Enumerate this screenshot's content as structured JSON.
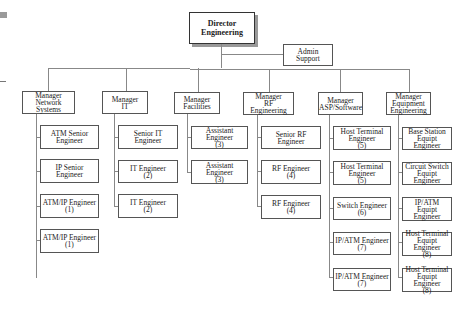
{
  "director": {
    "label": "Director\nEngineering"
  },
  "admin": {
    "label": "Admin Support"
  },
  "managers": [
    {
      "label": "Manager\nNetwork Systems",
      "reports": [
        "ATM Senior\nEngineer",
        "IP Senior Engineer",
        "ATM/IP Engineer\n(1)",
        "ATM/IP Engineer\n(1)"
      ]
    },
    {
      "label": "Manager\nIT",
      "reports": [
        "Senior IT Engineer",
        "IT Engineer\n(2)",
        "IT Engineer\n(2)"
      ]
    },
    {
      "label": "Manager\nFacilities",
      "reports": [
        "Assistant Engineer\n(3)",
        "Assistant Engineer\n(3)"
      ]
    },
    {
      "label": "Manager\nRF Engineering",
      "reports": [
        "Senior RF Engineer",
        "RF Engineer\n(4)",
        "RF Engineer\n(4)"
      ]
    },
    {
      "label": "Manager\nASP/Software",
      "reports": [
        "Host Terminal\nEngineer\n(5)",
        "Host Terminal\nEngineer\n(5)",
        "Switch Engineer\n(6)",
        "IP/ATM Engineer\n(7)",
        "IP/ATM Engineer\n(7)"
      ]
    },
    {
      "label": "Manager\nEquipment\nEngineering",
      "reports": [
        "Base Station\nEquipt Engineer",
        "Circuit Switch\nEquipt Engineer",
        "IP/ATM\nEquipt Engineer",
        "Host Terminal\nEquipt Engineer\n(8)",
        "Host Terminal\nEquipt Engineer\n(8)"
      ]
    }
  ]
}
